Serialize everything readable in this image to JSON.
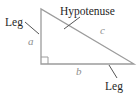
{
  "diagram": {
    "labels": {
      "leg_left": "Leg",
      "hypotenuse": "Hypotenuse",
      "leg_bottom": "Leg",
      "side_a": "a",
      "side_b": "b",
      "side_c": "c"
    },
    "colors": {
      "triangle_line": "#9c9c9c",
      "pointer_line": "#555555",
      "label_text": "#1f1f1f",
      "side_text": "#8f8f8f",
      "background": "#ffffff"
    }
  }
}
